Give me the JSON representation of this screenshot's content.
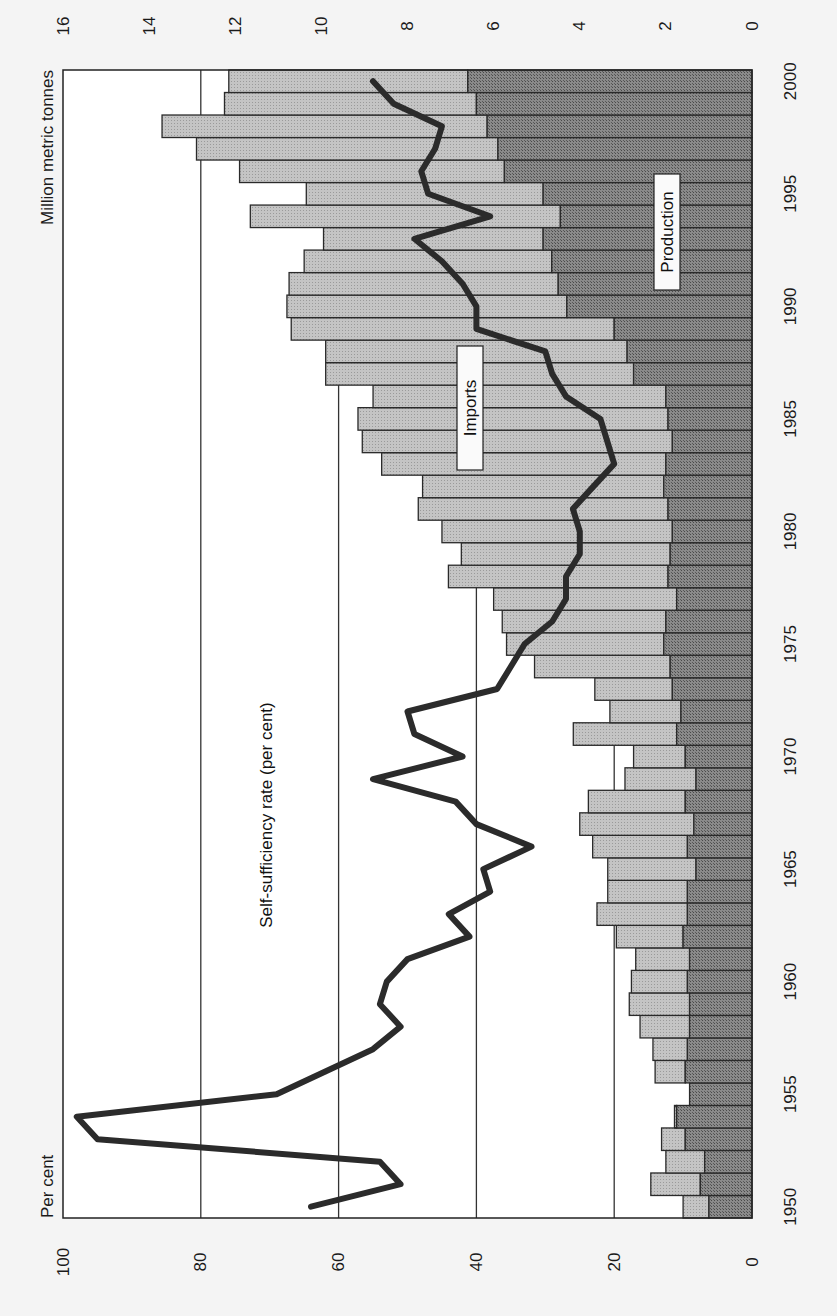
{
  "chart_data": {
    "type": "bar",
    "subtype": "stacked horizontal bar + line (figure rotated 90°)",
    "orientation": "rotated-90-clockwise",
    "title": "",
    "years": [
      1950,
      1951,
      1952,
      1953,
      1954,
      1955,
      1956,
      1957,
      1958,
      1959,
      1960,
      1961,
      1962,
      1963,
      1964,
      1965,
      1966,
      1967,
      1968,
      1969,
      1970,
      1971,
      1972,
      1973,
      1974,
      1975,
      1976,
      1977,
      1978,
      1979,
      1980,
      1981,
      1982,
      1983,
      1984,
      1985,
      1986,
      1987,
      1988,
      1989,
      1990,
      1991,
      1992,
      1993,
      1994,
      1995,
      1996,
      1997,
      1998,
      1999,
      2000
    ],
    "series": [
      {
        "name": "Production",
        "axis": "Million metric tonnes",
        "values": [
          1.0,
          1.2,
          1.1,
          1.55,
          1.75,
          1.45,
          1.55,
          1.5,
          1.45,
          1.45,
          1.5,
          1.45,
          1.6,
          1.5,
          1.5,
          1.3,
          1.5,
          1.35,
          1.55,
          1.3,
          1.55,
          1.75,
          1.65,
          1.85,
          1.9,
          2.05,
          2.0,
          1.75,
          1.95,
          1.9,
          1.85,
          1.95,
          2.05,
          2.0,
          1.85,
          1.95,
          2.0,
          2.75,
          2.9,
          3.2,
          4.3,
          4.5,
          4.65,
          4.85,
          4.45,
          4.85,
          5.75,
          5.9,
          6.15,
          6.4,
          6.6
        ]
      },
      {
        "name": "Imports",
        "axis": "Million metric tonnes",
        "values": [
          0.6,
          1.15,
          0.9,
          0.55,
          0.05,
          0.0,
          0.7,
          0.8,
          1.15,
          1.4,
          1.3,
          1.25,
          1.55,
          2.1,
          1.85,
          2.05,
          2.2,
          2.65,
          2.25,
          1.65,
          1.2,
          2.4,
          1.65,
          1.8,
          3.15,
          3.65,
          3.8,
          4.25,
          5.1,
          4.85,
          5.35,
          5.8,
          5.6,
          6.6,
          7.2,
          7.2,
          6.8,
          7.15,
          7.0,
          7.5,
          6.5,
          6.25,
          5.75,
          5.1,
          7.2,
          5.5,
          6.15,
          7.0,
          7.55,
          5.85,
          5.55
        ]
      },
      {
        "name": "Self-sufficiency rate (per cent)",
        "axis": "Per cent",
        "type": "line",
        "values": [
          64,
          51,
          54,
          95,
          98,
          69,
          62,
          55,
          51,
          54,
          53,
          50,
          41,
          44,
          38,
          39,
          32,
          40,
          43,
          55,
          42,
          49,
          50,
          37,
          35,
          33,
          29,
          27,
          27,
          25,
          25,
          26,
          23,
          20,
          21,
          22,
          27,
          29,
          30,
          40,
          40,
          42,
          45,
          49,
          38,
          47,
          48,
          46,
          45,
          52,
          55
        ]
      }
    ],
    "x_axis": {
      "label": "",
      "range": [
        1950,
        2000
      ],
      "ticks": [
        "1950",
        "1955",
        "1960",
        "1965",
        "1970",
        "1975",
        "1980",
        "1985",
        "1990",
        "1995",
        "2000"
      ]
    },
    "y_axis_left": {
      "label": "Per cent",
      "range": [
        0,
        100
      ],
      "ticks": [
        "0",
        "20",
        "40",
        "60",
        "80",
        "100"
      ]
    },
    "y_axis_right": {
      "label": "Million metric tonnes",
      "range": [
        0,
        16
      ],
      "ticks": [
        "0",
        "2",
        "4",
        "6",
        "8",
        "10",
        "12",
        "14",
        "16"
      ]
    },
    "gridlines": [
      20,
      40,
      60,
      80
    ],
    "annotations": [
      "Imports",
      "Production",
      "Self-sufficiency rate (per cent)"
    ],
    "legend": "none (inline labels)"
  },
  "labels": {
    "percent_axis_title": "Per cent",
    "tonnes_axis_title": "Million metric tonnes",
    "imports": "Imports",
    "production": "Production",
    "line": "Self-sufficiency rate (per cent)"
  },
  "colors": {
    "production": "#7a7a7a",
    "imports": "#bcbcbc",
    "line": "#2b2b2b",
    "grid": "#333333",
    "background": "#ffffff"
  }
}
